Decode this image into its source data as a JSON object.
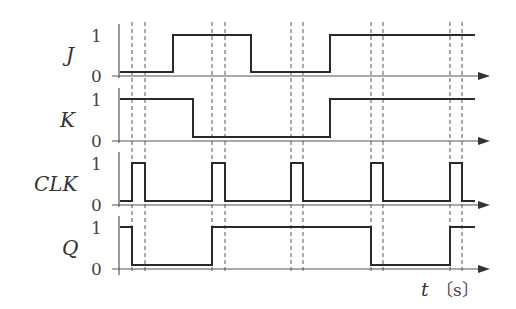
{
  "diagram": {
    "time_axis": {
      "variable": "t",
      "unit": "〔s〕"
    },
    "levels": {
      "high": "1",
      "low": "0"
    },
    "clock_edges_x": [
      132,
      212,
      291,
      371,
      450
    ],
    "clock_falls_x": [
      145,
      225,
      303,
      383,
      462
    ],
    "signals": [
      {
        "name": "J",
        "label": "J",
        "initial": 0,
        "transitions_x": [
          173,
          251,
          330
        ]
      },
      {
        "name": "K",
        "label": "K",
        "initial": 1,
        "transitions_x": [
          193,
          330
        ]
      },
      {
        "name": "CLK",
        "label": "CLK",
        "initial": 0,
        "transitions_x": [
          132,
          145,
          212,
          225,
          291,
          303,
          371,
          383,
          450,
          462
        ]
      },
      {
        "name": "Q",
        "label": "Q",
        "initial": 1,
        "transitions_x": [
          132,
          212,
          371,
          450
        ]
      }
    ],
    "colors": {
      "signal": "#2a2a2a",
      "axis": "#555555",
      "text": "#333333"
    }
  }
}
